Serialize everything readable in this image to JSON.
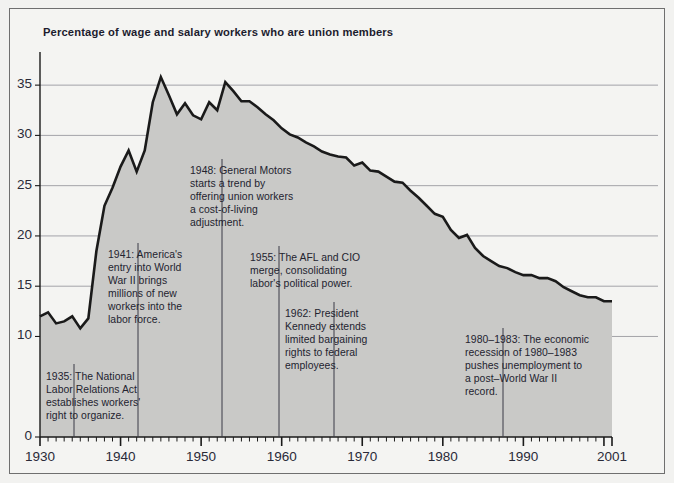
{
  "figure": {
    "title": "Percentage of wage and salary workers who are union members",
    "background_color": "#f2f2f0",
    "frame_color": "#6f6f6f",
    "area_fill_color": "#c9c9c7",
    "line_color": "#1a1a1a",
    "gridline_color": "#9a9aa0",
    "text_color": "#23232f"
  },
  "chart_data": {
    "type": "area",
    "title": "Percentage of wage and salary workers who are union members",
    "xlabel": "",
    "ylabel": "",
    "xlim": [
      1930,
      2001
    ],
    "ylim": [
      0,
      37.5
    ],
    "grid": true,
    "legend": "none",
    "ytick_labels": [
      "0",
      "10",
      "15",
      "20",
      "25",
      "30",
      "35"
    ],
    "ytick_values": [
      0,
      10,
      15,
      20,
      25,
      30,
      35
    ],
    "xtick_labels": [
      "1930",
      "1940",
      "1950",
      "1960",
      "1970",
      "1980",
      "1990",
      "2001"
    ],
    "xtick_values": [
      1930,
      1940,
      1950,
      1960,
      1970,
      1980,
      1990,
      2001
    ],
    "minor_xtick_interval": 1,
    "series_name": "Union membership rate",
    "x": [
      1930,
      1931,
      1932,
      1933,
      1934,
      1935,
      1936,
      1937,
      1938,
      1939,
      1940,
      1941,
      1942,
      1943,
      1944,
      1945,
      1946,
      1947,
      1948,
      1949,
      1950,
      1951,
      1952,
      1953,
      1954,
      1955,
      1956,
      1957,
      1958,
      1959,
      1960,
      1961,
      1962,
      1963,
      1964,
      1965,
      1966,
      1967,
      1968,
      1969,
      1970,
      1971,
      1972,
      1973,
      1974,
      1975,
      1976,
      1977,
      1978,
      1979,
      1980,
      1981,
      1982,
      1983,
      1984,
      1985,
      1986,
      1987,
      1988,
      1989,
      1990,
      1991,
      1992,
      1993,
      1994,
      1995,
      1996,
      1997,
      1998,
      1999,
      2000,
      2001
    ],
    "values": [
      12.0,
      12.4,
      11.3,
      11.5,
      12.0,
      10.8,
      11.8,
      18.5,
      23.0,
      24.8,
      26.9,
      28.5,
      26.4,
      28.5,
      33.3,
      35.8,
      34.0,
      32.1,
      33.2,
      32.0,
      31.6,
      33.3,
      32.5,
      35.3,
      34.4,
      33.4,
      33.4,
      32.8,
      32.1,
      31.5,
      30.7,
      30.1,
      29.8,
      29.3,
      28.9,
      28.4,
      28.1,
      27.9,
      27.8,
      27.0,
      27.3,
      26.5,
      26.4,
      25.9,
      25.4,
      25.3,
      24.5,
      23.8,
      23.0,
      22.2,
      21.9,
      20.6,
      19.8,
      20.1,
      18.8,
      18.0,
      17.5,
      17.0,
      16.8,
      16.4,
      16.1,
      16.1,
      15.8,
      15.8,
      15.5,
      14.9,
      14.5,
      14.1,
      13.9,
      13.9,
      13.5,
      13.5
    ],
    "annotations": [
      {
        "year": 1935,
        "lines": [
          "1935: The National",
          "Labor Relations Act",
          "establishes workers'",
          "right to organize."
        ]
      },
      {
        "year": 1941,
        "lines": [
          "1941: America's",
          "entry into World",
          "War II brings",
          "millions of new",
          "workers into the",
          "labor force."
        ]
      },
      {
        "year": 1948,
        "lines": [
          "1948: General Motors",
          "starts a trend by",
          "offering union workers",
          "a cost-of-living",
          "adjustment."
        ]
      },
      {
        "year": 1955,
        "lines": [
          "1955: The AFL and CIO",
          "merge, consolidating",
          "labor's political power."
        ]
      },
      {
        "year": 1962,
        "lines": [
          "1962: President",
          "Kennedy extends",
          "limited bargaining",
          "rights to federal",
          "employees."
        ]
      },
      {
        "year": 1980,
        "lines": [
          "1980–1983: The economic",
          "recession of 1980–1983",
          "pushes unemployment to",
          "a post–World War II",
          "record."
        ]
      }
    ]
  },
  "annotation_positions": [
    {
      "key": "a1935",
      "left": 46,
      "top": 371,
      "pointer_x": 74,
      "pointer_top": 364,
      "pointer_bottom": 437
    },
    {
      "key": "a1941",
      "left": 108,
      "top": 249,
      "pointer_x": 138,
      "pointer_top": 243,
      "pointer_bottom": 437
    },
    {
      "key": "a1948",
      "left": 190,
      "top": 165,
      "pointer_x": 222,
      "pointer_top": 159,
      "pointer_bottom": 437
    },
    {
      "key": "a1955",
      "left": 250,
      "top": 252,
      "pointer_x": 279,
      "pointer_top": 246,
      "pointer_bottom": 437
    },
    {
      "key": "a1962",
      "left": 285,
      "top": 308,
      "pointer_x": 334,
      "pointer_top": 302,
      "pointer_bottom": 437
    },
    {
      "key": "a1980",
      "left": 465,
      "top": 334,
      "pointer_x": 503,
      "pointer_top": 328,
      "pointer_bottom": 437
    }
  ]
}
